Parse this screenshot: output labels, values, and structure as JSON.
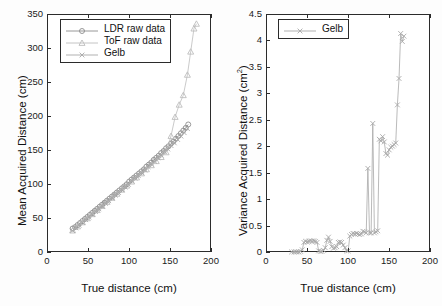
{
  "figure": {
    "panels": [
      "left",
      "right"
    ]
  },
  "colors": {
    "axis": "#2b2b2b",
    "ldr": "#8c8c8c",
    "tof": "#bdbdbd",
    "gelb": "#a8a8a8",
    "text": "#1a1a1a",
    "background": "#ffffff"
  },
  "left_panel": {
    "xlabel": "True distance (cm)",
    "ylabel_text": "Mean Acquired Distance (cm)",
    "xticks": [
      "0",
      "50",
      "100",
      "150",
      "200"
    ],
    "yticks": [
      "0",
      "50",
      "100",
      "150",
      "200",
      "250",
      "300",
      "350"
    ],
    "legend": [
      {
        "label": "LDR raw data",
        "marker": "circle-marker"
      },
      {
        "label": "ToF raw data",
        "marker": "triangle-marker"
      },
      {
        "label": "Gelb",
        "marker": "x-marker"
      }
    ]
  },
  "right_panel": {
    "xlabel": "True distance (cm)",
    "ylabel_prefix": "Variance Acquired Distance (cm",
    "ylabel_sup": "2",
    "ylabel_suffix": ")",
    "xticks": [
      "0",
      "50",
      "100",
      "150",
      "200"
    ],
    "yticks": [
      "0",
      "0.5",
      "1",
      "1.5",
      "2",
      "2.5",
      "3",
      "3.5",
      "4",
      "4.5"
    ],
    "legend": [
      {
        "label": "Gelb",
        "marker": "x-marker"
      }
    ]
  },
  "chart_data": [
    {
      "type": "line",
      "panel": "left",
      "title": "",
      "xlabel": "True distance (cm)",
      "ylabel": "Mean Acquired Distance (cm)",
      "xlim": [
        0,
        200
      ],
      "ylim": [
        0,
        350
      ],
      "xticks": [
        0,
        50,
        100,
        150,
        200
      ],
      "yticks": [
        0,
        50,
        100,
        150,
        200,
        250,
        300,
        350
      ],
      "grid": false,
      "legend_position": "upper-left",
      "series": [
        {
          "name": "LDR raw data",
          "marker": "circle",
          "color": "#8c8c8c",
          "x": [
            30,
            33,
            36,
            39,
            42,
            45,
            48,
            51,
            54,
            57,
            60,
            63,
            66,
            69,
            72,
            75,
            78,
            81,
            84,
            87,
            90,
            93,
            96,
            99,
            102,
            105,
            108,
            111,
            114,
            117,
            120,
            123,
            126,
            129,
            132,
            135,
            138,
            141,
            144,
            147,
            150,
            153,
            156,
            159,
            162,
            165,
            168,
            171
          ],
          "y": [
            36,
            38,
            41,
            44,
            47,
            50,
            53,
            56,
            59,
            62,
            65,
            68,
            71,
            74,
            77,
            80,
            83,
            86,
            89,
            92,
            95,
            98,
            101,
            105,
            108,
            111,
            114,
            117,
            120,
            123,
            127,
            130,
            133,
            137,
            140,
            143,
            147,
            150,
            154,
            157,
            161,
            164,
            168,
            172,
            176,
            180,
            184,
            189
          ]
        },
        {
          "name": "ToF raw data",
          "marker": "triangle",
          "color": "#bdbdbd",
          "x": [
            30,
            36,
            42,
            48,
            54,
            60,
            66,
            72,
            78,
            84,
            90,
            96,
            102,
            108,
            114,
            120,
            126,
            132,
            138,
            144,
            150,
            155,
            160,
            165,
            170,
            174,
            178,
            181
          ],
          "y": [
            33,
            39,
            45,
            51,
            57,
            63,
            69,
            75,
            81,
            87,
            93,
            99,
            105,
            111,
            117,
            123,
            129,
            135,
            141,
            148,
            172,
            200,
            218,
            232,
            262,
            296,
            330,
            337
          ]
        },
        {
          "name": "Gelb",
          "marker": "x",
          "color": "#a8a8a8",
          "x": [
            30,
            34,
            38,
            42,
            46,
            50,
            54,
            58,
            62,
            66,
            70,
            74,
            78,
            82,
            86,
            90,
            94,
            98,
            102,
            106,
            110,
            114,
            118,
            122,
            126,
            130,
            134,
            138,
            142,
            146,
            150,
            154,
            158,
            162,
            166,
            170
          ],
          "y": [
            33,
            37,
            41,
            45,
            49,
            53,
            57,
            61,
            65,
            69,
            73,
            77,
            81,
            85,
            89,
            93,
            97,
            101,
            106,
            110,
            114,
            118,
            122,
            127,
            131,
            135,
            140,
            144,
            149,
            153,
            158,
            162,
            167,
            172,
            177,
            183
          ]
        }
      ]
    },
    {
      "type": "line",
      "panel": "right",
      "title": "",
      "xlabel": "True distance (cm)",
      "ylabel": "Variance Acquired Distance (cm^2)",
      "xlim": [
        0,
        200
      ],
      "ylim": [
        0,
        4.5
      ],
      "xticks": [
        0,
        50,
        100,
        150,
        200
      ],
      "yticks": [
        0,
        0.5,
        1,
        1.5,
        2,
        2.5,
        3,
        3.5,
        4,
        4.5
      ],
      "grid": false,
      "legend_position": "upper-left",
      "series": [
        {
          "name": "Gelb",
          "marker": "x",
          "color": "#a8a8a8",
          "x": [
            30,
            33,
            35,
            37,
            39,
            41,
            43,
            45,
            47,
            49,
            51,
            53,
            55,
            57,
            59,
            61,
            63,
            65,
            67,
            69,
            71,
            73,
            75,
            77,
            79,
            81,
            83,
            85,
            87,
            89,
            91,
            93,
            95,
            97,
            99,
            101,
            103,
            105,
            107,
            109,
            111,
            113,
            115,
            117,
            119,
            121,
            123,
            125,
            127,
            129,
            131,
            133,
            135,
            137,
            139,
            141,
            143,
            145,
            147,
            149,
            151,
            153,
            155,
            157,
            159,
            161,
            163,
            165,
            167
          ],
          "y": [
            0.02,
            0.02,
            0.02,
            0.02,
            0.02,
            0.03,
            0.06,
            0.2,
            0.22,
            0.21,
            0.22,
            0.23,
            0.22,
            0.23,
            0.22,
            0.2,
            0.04,
            0.03,
            0.03,
            0.05,
            0.1,
            0.24,
            0.3,
            0.22,
            0.12,
            0.09,
            0.1,
            0.12,
            0.2,
            0.21,
            0.2,
            0.15,
            0.1,
            0.04,
            0.04,
            0.32,
            0.35,
            0.37,
            0.36,
            0.37,
            0.36,
            0.35,
            0.36,
            0.41,
            0.4,
            0.38,
            1.6,
            0.38,
            0.38,
            2.45,
            0.38,
            0.4,
            0.42,
            2.15,
            2.12,
            2.2,
            2.1,
            1.88,
            1.85,
            1.95,
            2.0,
            2.02,
            2.05,
            2.08,
            2.8,
            3.3,
            4.15,
            4.0,
            4.1
          ]
        }
      ]
    }
  ]
}
